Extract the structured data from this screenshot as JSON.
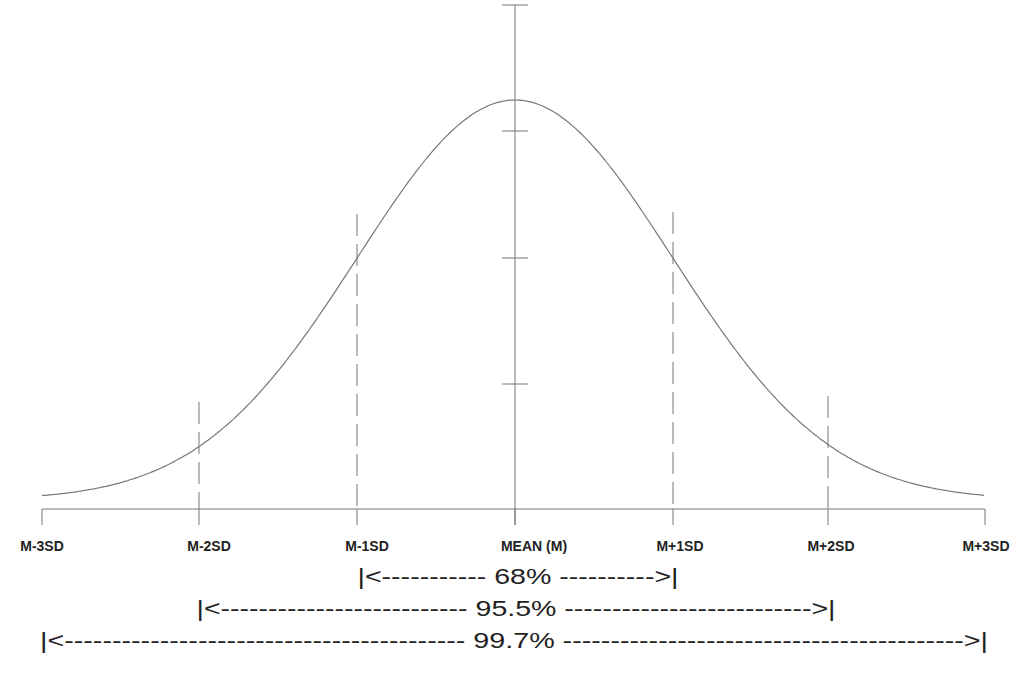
{
  "chart_data": {
    "type": "line",
    "title": "",
    "x_ticks": [
      "M-3SD",
      "M-2SD",
      "M-1SD",
      "MEAN (M)",
      "M+1SD",
      "M+2SD",
      "M+3SD"
    ],
    "x_values": [
      -3,
      -2,
      -1,
      0,
      1,
      2,
      3
    ],
    "curve": "gaussian",
    "y_axis_ticks": 4,
    "ranges": [
      {
        "from": "M-1SD",
        "to": "M+1SD",
        "label": "68%"
      },
      {
        "from": "M-2SD",
        "to": "M+2SD",
        "label": "95.5%"
      },
      {
        "from": "M-3SD",
        "to": "M+3SD",
        "label": "99.7%"
      }
    ],
    "grid": false,
    "colors": {
      "line": "#666666",
      "text": "#222222"
    }
  },
  "labels": {
    "m3": "M-3SD",
    "m2": "M-2SD",
    "m1": "M-1SD",
    "mean": "MEAN (M)",
    "p1": "M+1SD",
    "p2": "M+2SD",
    "p3": "M+3SD"
  },
  "ranges": {
    "r68": "|<----------- 68% ---------->|",
    "r955": "|<-------------------------- 95.5% -------------------------->|",
    "r997": "|<------------------------------------------ 99.7% ------------------------------------------>|"
  }
}
